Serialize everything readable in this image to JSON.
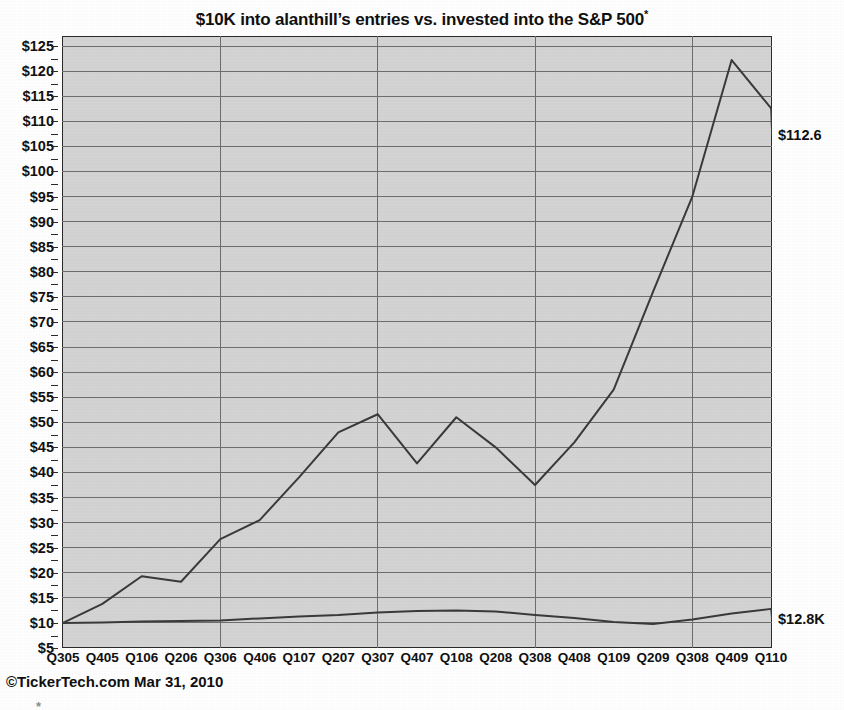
{
  "title": {
    "text": "$10K into alanthill’s entries vs. invested into the S&P 500",
    "footnote_marker": "*"
  },
  "footer": {
    "credit": "©TickerTech.com Mar 31, 2010",
    "footnote_marker": "*"
  },
  "labels": {
    "portfolio_end": "$112.6",
    "benchmark_end": "$12.8K"
  },
  "colors": {
    "plot_background": "#d4d4d4",
    "axis": "#2b2b2b",
    "gridline": "#6e6e6e",
    "series_line": "#3a3a3a",
    "text": "#111111"
  },
  "chart_data": {
    "type": "line",
    "title": "$10K into alanthill’s entries vs. invested into the S&P 500*",
    "xlabel": "",
    "ylabel": "",
    "ylim": [
      5,
      127
    ],
    "ytick_values": [
      5,
      10,
      15,
      20,
      25,
      30,
      35,
      40,
      45,
      50,
      55,
      60,
      65,
      70,
      75,
      80,
      85,
      90,
      95,
      100,
      105,
      110,
      115,
      120,
      125
    ],
    "ytick_labels": [
      "$5",
      "$10",
      "$15",
      "$20",
      "$25",
      "$30",
      "$35",
      "$40",
      "$45",
      "$50",
      "$55",
      "$60",
      "$65",
      "$70",
      "$75",
      "$80",
      "$85",
      "$90",
      "$95",
      "$100",
      "$105",
      "$110",
      "$115",
      "$120",
      "$125"
    ],
    "grid": true,
    "grid_axis": "both",
    "legend": false,
    "categories": [
      "Q305",
      "Q405",
      "Q106",
      "Q206",
      "Q306",
      "Q406",
      "Q107",
      "Q207",
      "Q307",
      "Q407",
      "Q108",
      "Q208",
      "Q308",
      "Q408",
      "Q109",
      "Q209",
      "Q308",
      "Q409",
      "Q110"
    ],
    "vertical_gridline_categories": [
      "Q306",
      "Q307",
      "Q308",
      "Q309"
    ],
    "series": [
      {
        "name": "alanthill entries",
        "end_label": "$112.6",
        "values": [
          10.0,
          13.8,
          19.3,
          18.2,
          26.7,
          30.5,
          39.0,
          48.0,
          51.6,
          41.8,
          51.0,
          45.0,
          37.5,
          46.0,
          56.5,
          76.0,
          95.0,
          122.2,
          112.6
        ]
      },
      {
        "name": "S&P 500",
        "end_label": "$12.8K",
        "values": [
          10.0,
          10.1,
          10.3,
          10.4,
          10.5,
          10.9,
          11.3,
          11.6,
          12.1,
          12.4,
          12.5,
          12.3,
          11.6,
          11.0,
          10.2,
          9.8,
          10.7,
          11.9,
          12.8
        ]
      }
    ]
  }
}
